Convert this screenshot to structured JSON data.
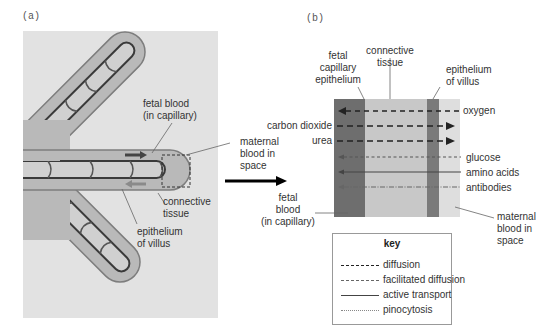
{
  "panels": {
    "a": {
      "tag": "(a)",
      "labels": {
        "fetal_blood_1": "fetal blood",
        "fetal_blood_2": "(in capillary)",
        "connective_1": "connective",
        "connective_2": "tissue",
        "epithelium_1": "epithelium",
        "epithelium_2": "of villus",
        "maternal_1": "maternal",
        "maternal_2": "blood in",
        "maternal_3": "space"
      }
    },
    "b": {
      "tag": "(b)",
      "labels": {
        "fetal_cap_1": "fetal",
        "fetal_cap_2": "capillary",
        "fetal_cap_3": "epithelium",
        "connective_1": "connective",
        "connective_2": "tissue",
        "epi_villus_1": "epithelium",
        "epi_villus_2": "of villus",
        "fetal_blood_1": "fetal",
        "fetal_blood_2": "blood",
        "fetal_blood_3": "(in capillary)",
        "maternal_1": "maternal",
        "maternal_2": "blood in",
        "maternal_3": "space"
      },
      "substances": [
        {
          "name": "oxygen",
          "side": "right",
          "direction": "to-fetal",
          "transport": "diffusion"
        },
        {
          "name": "carbon dioxide",
          "side": "left",
          "direction": "to-maternal",
          "transport": "diffusion"
        },
        {
          "name": "urea",
          "side": "left",
          "direction": "to-maternal",
          "transport": "diffusion"
        },
        {
          "name": "glucose",
          "side": "right",
          "direction": "to-fetal",
          "transport": "facilitated diffusion"
        },
        {
          "name": "amino acids",
          "side": "right",
          "direction": "to-fetal",
          "transport": "active transport"
        },
        {
          "name": "antibodies",
          "side": "right",
          "direction": "to-fetal",
          "transport": "pinocytosis"
        }
      ]
    }
  },
  "key": {
    "title": "key",
    "items": [
      {
        "label": "diffusion",
        "style": "dashed"
      },
      {
        "label": "facilitated diffusion",
        "style": "short-dashed"
      },
      {
        "label": "active transport",
        "style": "solid"
      },
      {
        "label": "pinocytosis",
        "style": "dash-dot"
      }
    ]
  },
  "colors": {
    "panel_bg": "#e2e2e2",
    "villus_fill": "#b9b9b9",
    "villus_outline": "#7d7d7d",
    "capillary_fill": "#cfcfcf",
    "capillary_outline": "#3a3a3a",
    "fetal_band": "#6e6e6e",
    "connective_band": "#c8c8c8",
    "epithelium_band": "#7a7a7a",
    "maternal_band": "#dedede"
  }
}
